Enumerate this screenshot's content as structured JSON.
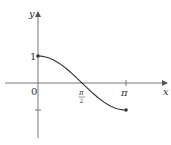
{
  "chart_data": {
    "type": "line",
    "title": "",
    "xlabel": "x",
    "ylabel": "y",
    "function": "cos(x), 0 ≤ x ≤ π",
    "x": [
      0,
      0.3927,
      0.7854,
      1.1781,
      1.5708,
      1.9635,
      2.3562,
      2.7489,
      3.1416
    ],
    "series": [
      {
        "name": "y = cos x",
        "values": [
          1,
          0.9239,
          0.7071,
          0.3827,
          0,
          -0.3827,
          -0.7071,
          -0.9239,
          -1
        ]
      }
    ],
    "endpoints": [
      {
        "x": 0,
        "y": 1,
        "filled": true
      },
      {
        "x": 3.1416,
        "y": -1,
        "filled": true
      }
    ],
    "x_ticks": [
      {
        "value": 0,
        "label": "0"
      },
      {
        "value": 1.5708,
        "label_num": "π",
        "label_den": "2"
      },
      {
        "value": 3.1416,
        "label": "π"
      }
    ],
    "y_ticks": [
      {
        "value": 1,
        "label": "1"
      },
      {
        "value": -1,
        "label": ""
      }
    ],
    "xlim": [
      -1.1,
      4.6
    ],
    "ylim": [
      -2.0,
      2.6
    ],
    "grid": false,
    "legend": null
  },
  "labels": {
    "y_axis": "y",
    "x_axis": "x",
    "origin": "0",
    "one": "1",
    "pi_half_num": "π",
    "pi_half_den": "2",
    "pi": "π"
  },
  "colors": {
    "axis": "#555555",
    "curve": "#333333",
    "text": "#333333"
  }
}
